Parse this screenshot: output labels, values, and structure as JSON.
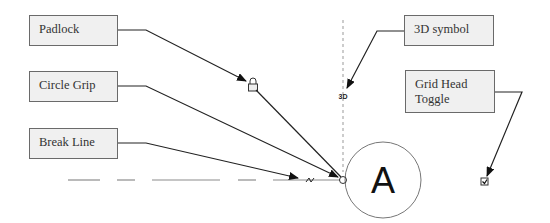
{
  "callouts": {
    "padlock": "Padlock",
    "circle_grip": "Circle Grip",
    "break_line": "Break Line",
    "symbol_3d": "3D symbol",
    "grid_head_toggle": "Grid Head Toggle"
  },
  "grid": {
    "label": "A",
    "symbol_3d_text": "3D"
  },
  "icons": {
    "padlock": "padlock-icon",
    "circle_grip": "circle-grip-icon",
    "break_line": "break-line-icon",
    "toggle": "checkbox-icon"
  },
  "colors": {
    "line": "#222222",
    "dash": "#8c8c8c",
    "box_bg": "#f0f0f0",
    "box_border": "#6a6a6a"
  }
}
